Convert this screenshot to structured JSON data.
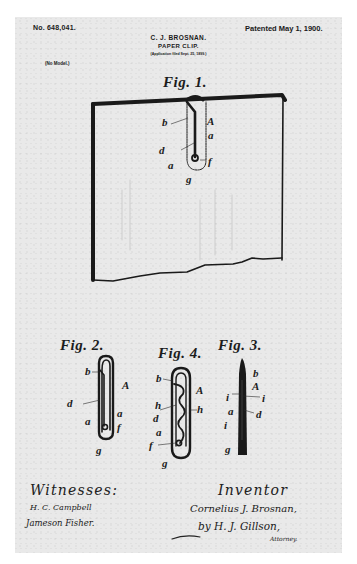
{
  "document": {
    "type": "US patent drawing sheet",
    "header": {
      "patent_number": "No. 648,041.",
      "patent_date": "Patented May 1, 1900.",
      "inventor": "C. J. BROSNAN.",
      "title": "PAPER CLIP.",
      "application_filed": "(Application filed Sept. 25, 1899.)",
      "model_note": "(No Model.)"
    },
    "figures": [
      {
        "id": "fig1",
        "label": "Fig. 1.",
        "description": "Paper clip attached to a sheet of paper",
        "part_labels": [
          "b",
          "A",
          "a",
          "d",
          "a",
          "f",
          "g"
        ]
      },
      {
        "id": "fig2",
        "label": "Fig. 2.",
        "description": "Paper clip front view",
        "part_labels": [
          "b",
          "A",
          "d",
          "a",
          "a",
          "f",
          "g"
        ]
      },
      {
        "id": "fig4",
        "label": "Fig. 4.",
        "description": "Paper clip with wavy inner tongue",
        "part_labels": [
          "b",
          "A",
          "h",
          "h",
          "d",
          "a",
          "f",
          "g"
        ]
      },
      {
        "id": "fig3",
        "label": "Fig. 3.",
        "description": "Paper clip edge view",
        "part_labels": [
          "b",
          "A",
          "i",
          "i",
          "a",
          "d",
          "i",
          "g"
        ]
      }
    ],
    "signatures": {
      "witnesses_heading": "Witnesses:",
      "witnesses": [
        "H. C. Campbell",
        "Jameson Fisher."
      ],
      "inventor_heading": "Inventor",
      "inventor_signature": "Cornelius J. Brosnan,",
      "by_signature": "by H. J. Gillson,",
      "attorney_note": "Attorney."
    }
  }
}
